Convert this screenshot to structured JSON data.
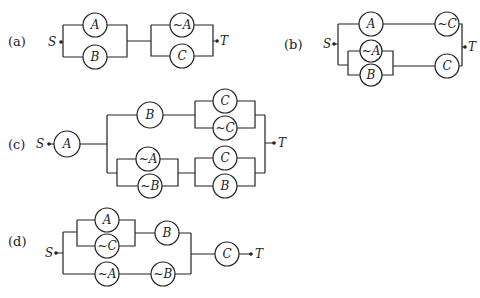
{
  "figures": [
    {
      "id": "a",
      "label": "(a)",
      "source": "S",
      "terminal": "T",
      "components": [
        "A",
        "B",
        "~A",
        "C"
      ]
    },
    {
      "id": "b",
      "label": "(b)",
      "source": "S",
      "terminal": "T",
      "components": [
        "A",
        "~C",
        "~A",
        "B",
        "C"
      ]
    },
    {
      "id": "c",
      "label": "(c)",
      "source": "S",
      "terminal": "T",
      "components": [
        "A",
        "B",
        "C",
        "~C",
        "~A",
        "~B",
        "C",
        "B"
      ]
    },
    {
      "id": "d",
      "label": "(d)",
      "source": "S",
      "terminal": "T",
      "components": [
        "A",
        "~C",
        "B",
        "~A",
        "~B",
        "C"
      ]
    }
  ],
  "colors": {
    "ink": "#222222",
    "background": "#ffffff"
  }
}
